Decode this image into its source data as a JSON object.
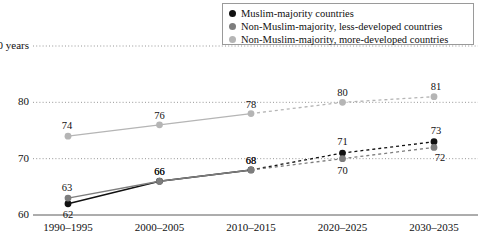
{
  "chart_data": {
    "type": "line",
    "title": "",
    "xlabel": "",
    "ylabel": "",
    "ylim": [
      60,
      90
    ],
    "yticks": [
      60,
      70,
      80,
      90
    ],
    "ytick_labels": [
      "60",
      "70",
      "80",
      "90 years"
    ],
    "grid": true,
    "gridlines_at": [
      70,
      80,
      90
    ],
    "axis_line_at": 60,
    "legend_position": "top-right",
    "categories": [
      "1990–1995",
      "2000–2005",
      "2010–2015",
      "2020–2025",
      "2030–2035"
    ],
    "projection_starts_after_index": 2,
    "series": [
      {
        "name": "Muslim-majority countries",
        "color": "#111111",
        "values": [
          62,
          66,
          68,
          71,
          73
        ],
        "labels": [
          "62",
          "66",
          "68",
          "71",
          "73"
        ]
      },
      {
        "name": "Non-Muslim-majority, less-developed countries",
        "color": "#7d7d7d",
        "values": [
          63,
          66,
          68,
          70,
          72
        ],
        "labels": [
          "63",
          "66",
          "68",
          "70",
          "72"
        ]
      },
      {
        "name": "Non-Muslim-majority, more-developed countries",
        "color": "#b5b5b5",
        "values": [
          74,
          76,
          78,
          80,
          81
        ],
        "labels": [
          "74",
          "76",
          "78",
          "80",
          "81"
        ]
      }
    ]
  },
  "legend": {
    "items": [
      {
        "label": "Muslim-majority countries",
        "color": "#111111"
      },
      {
        "label": "Non-Muslim-majority, less-developed countries",
        "color": "#7d7d7d"
      },
      {
        "label": "Non-Muslim-majority, more-developed countries",
        "color": "#b5b5b5"
      }
    ]
  },
  "y_axis": {
    "ticks": [
      {
        "label": "90 years",
        "value": 90
      },
      {
        "label": "80",
        "value": 80
      },
      {
        "label": "70",
        "value": 70
      },
      {
        "label": "60",
        "value": 60
      }
    ]
  },
  "x_axis": {
    "ticks": [
      "1990–1995",
      "2000–2005",
      "2010–2015",
      "2020–2025",
      "2030–2035"
    ]
  },
  "point_labels": {
    "black": [
      "62",
      "66",
      "68",
      "71",
      "73"
    ],
    "gray": [
      "63",
      "66",
      "68",
      "70",
      "72"
    ],
    "light": [
      "74",
      "76",
      "78",
      "80",
      "81"
    ]
  }
}
